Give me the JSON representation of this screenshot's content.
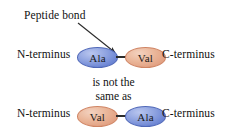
{
  "figure": {
    "annotation": {
      "label": "Peptide bond",
      "arrow": {
        "from_x": 78,
        "from_y": 23,
        "to_x": 117,
        "to_y": 54
      }
    },
    "middle_text": {
      "line1": "is not the",
      "line2": "same as"
    },
    "rows": [
      {
        "id": "ala-val",
        "n_terminus": "N-terminus",
        "c_terminus": "C-terminus",
        "residues": [
          {
            "label": "Ala",
            "color": "#7d93da",
            "style": "blue"
          },
          {
            "label": "Val",
            "color": "#e5a286",
            "style": "salmon"
          }
        ],
        "bond_color": "#2b2b2b"
      },
      {
        "id": "val-ala",
        "n_terminus": "N-terminus",
        "c_terminus": "C-terminus",
        "residues": [
          {
            "label": "Val",
            "color": "#e5a286",
            "style": "salmon"
          },
          {
            "label": "Ala",
            "color": "#7d93da",
            "style": "blue"
          }
        ],
        "bond_color": "#2b2b2b"
      }
    ],
    "colors": {
      "background": "#ffffff",
      "text": "#111111",
      "alanine": "#7d93da",
      "valine": "#e5a286",
      "bond": "#2b2b2b"
    }
  }
}
